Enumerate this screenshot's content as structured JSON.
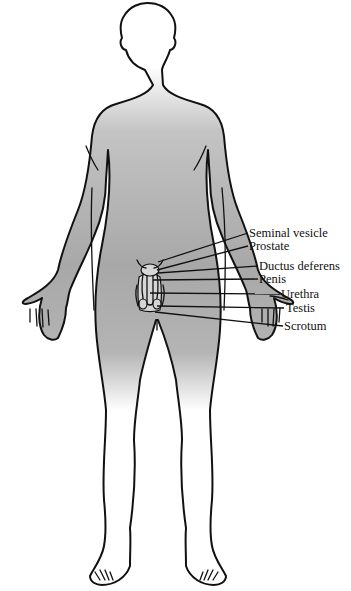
{
  "figure": {
    "colors": {
      "body_shade_dark": "#a9a9a9",
      "body_shade_light": "#ffffff",
      "outline": "#111111"
    },
    "labels": [
      {
        "id": "seminal-vesicle",
        "text": "Seminal vesicle"
      },
      {
        "id": "prostate",
        "text": "Prostate"
      },
      {
        "id": "ductus-deferens",
        "text": "Ductus deferens"
      },
      {
        "id": "penis",
        "text": "Penis"
      },
      {
        "id": "urethra",
        "text": "Urethra"
      },
      {
        "id": "testis",
        "text": "Testis"
      },
      {
        "id": "scrotum",
        "text": "Scrotum"
      }
    ]
  }
}
